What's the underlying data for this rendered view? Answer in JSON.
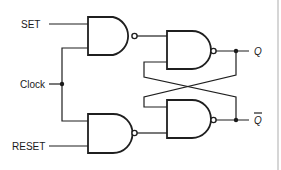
{
  "diagram": {
    "inputs": {
      "set": "SET",
      "clock": "Clock",
      "reset": "RESET"
    },
    "outputs": {
      "q": "Q",
      "q_bar": "Q"
    },
    "gates": [
      {
        "id": "input-nand-set",
        "type": "NAND"
      },
      {
        "id": "input-nand-reset",
        "type": "NAND"
      },
      {
        "id": "latch-nand-q",
        "type": "NAND"
      },
      {
        "id": "latch-nand-qbar",
        "type": "NAND"
      }
    ],
    "colors": {
      "line": "#1f1f1f",
      "background": "#ffffff"
    }
  }
}
